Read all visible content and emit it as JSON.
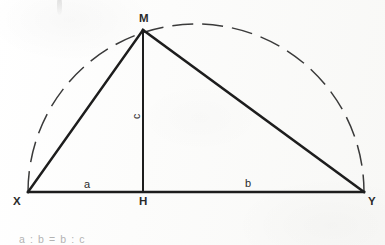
{
  "figure": {
    "colors": {
      "ink": "#1d1d1d",
      "paper": "#fbfbfa",
      "dashed_arc": "#3a3a3a",
      "faint_text": "#9a9a9a"
    },
    "points": {
      "M": {
        "label": "M",
        "x": 143,
        "y": 30
      },
      "X": {
        "label": "X",
        "x": 28,
        "y": 192
      },
      "Y": {
        "label": "Y",
        "x": 364,
        "y": 192
      },
      "H": {
        "label": "H",
        "x": 143,
        "y": 192
      }
    },
    "segments": [
      {
        "name": "baseline-XY",
        "label": "",
        "from": "X",
        "to": "Y",
        "style": "solid"
      },
      {
        "name": "side-XM",
        "label": "",
        "from": "X",
        "to": "M",
        "style": "solid"
      },
      {
        "name": "side-MY",
        "label": "",
        "from": "M",
        "to": "Y",
        "style": "solid"
      },
      {
        "name": "altitude-MH",
        "label": "",
        "from": "M",
        "to": "H",
        "style": "solid"
      }
    ],
    "segment_labels": {
      "a": "a",
      "b": "b",
      "c": "c"
    },
    "arc": {
      "name": "semicircle",
      "style": "dashed",
      "center_x": 196,
      "center_y": 192,
      "radius": 168
    },
    "formula": "a : b = b : c"
  }
}
